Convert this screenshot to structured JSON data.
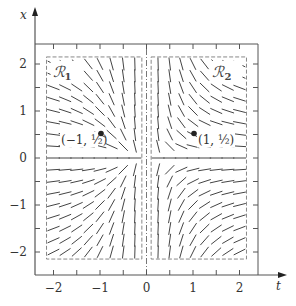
{
  "chart_data": {
    "type": "direction-field",
    "title": "",
    "equation": "dx/dt = -x/t^2",
    "xlabel": "t",
    "ylabel": "x",
    "xlim": [
      -2.35,
      2.35
    ],
    "ylim": [
      -2.45,
      2.45
    ],
    "xticks": [
      -2,
      -1,
      0,
      1,
      2
    ],
    "yticks": [
      -2,
      -1,
      0,
      1,
      2
    ],
    "xtick_labels": [
      "−2",
      "−1",
      "0",
      "1",
      "2"
    ],
    "ytick_labels": [
      "−2",
      "−1",
      "0",
      "1",
      "2"
    ],
    "minor_step": 0.5,
    "grid": false,
    "field": {
      "t_values": [
        -2,
        -1.75,
        -1.5,
        -1.25,
        -1,
        -0.75,
        -0.5,
        -0.25,
        0.25,
        0.5,
        0.75,
        1,
        1.25,
        1.5,
        1.75,
        2
      ],
      "x_values": [
        2,
        1.75,
        1.5,
        1.25,
        1,
        0.75,
        0.5,
        0.25,
        0,
        -0.25,
        -0.5,
        -0.75,
        -1,
        -1.25,
        -1.5,
        -1.75,
        -2
      ]
    },
    "regions": [
      {
        "name": "R1",
        "label": "ℛ",
        "subscript": "1",
        "t_range": [
          -2.15,
          -0.1
        ],
        "x_range": [
          -2.15,
          2.15
        ]
      },
      {
        "name": "R2",
        "label": "ℛ",
        "subscript": "2",
        "t_range": [
          0.1,
          2.15
        ],
        "x_range": [
          -2.15,
          2.15
        ]
      }
    ],
    "points": [
      {
        "t": -1,
        "x": 0.5,
        "label": "(−1, ½)"
      },
      {
        "t": 1,
        "x": 0.5,
        "label": "(1, ½)"
      }
    ]
  }
}
